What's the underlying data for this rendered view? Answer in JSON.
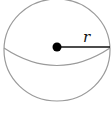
{
  "diagram": {
    "type": "sphere",
    "radius_label": "r",
    "colors": {
      "outline": "#9a9a9a",
      "radius_line": "#111111",
      "center_dot": "#000000",
      "label": "#111111",
      "background": "#ffffff"
    }
  }
}
